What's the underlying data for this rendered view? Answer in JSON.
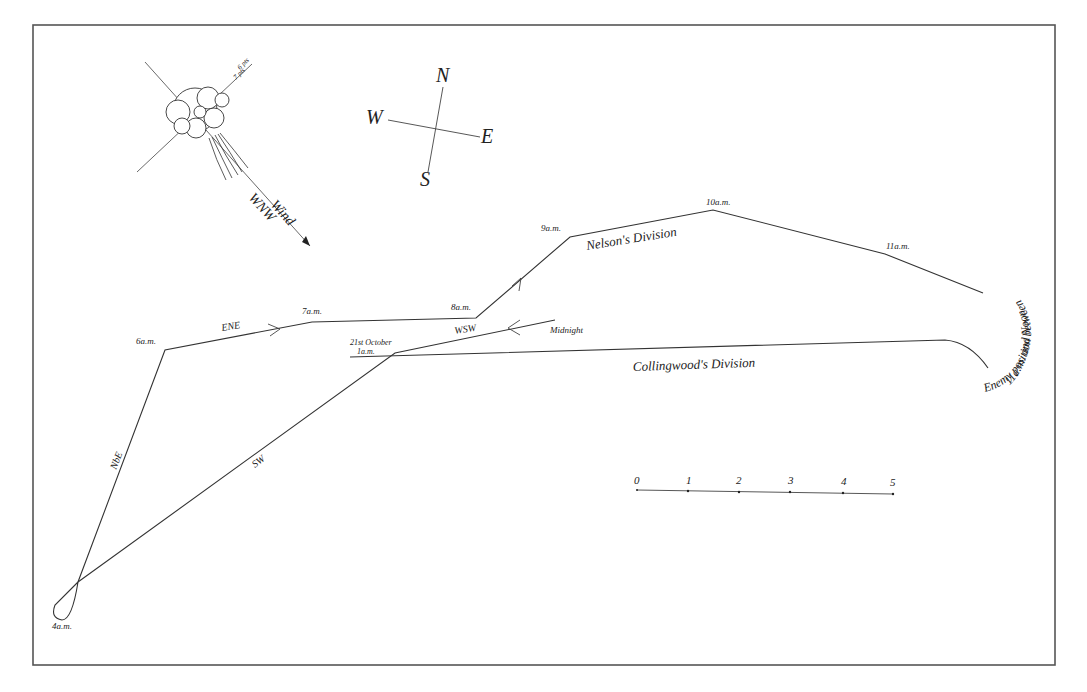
{
  "map": {
    "title": "Trafalgar approach tracks",
    "frame": {
      "x": 33,
      "y": 25,
      "width": 1022,
      "height": 640,
      "color": "#555555"
    },
    "compass": {
      "north": "N",
      "east": "E",
      "south": "S",
      "west": "W"
    },
    "wind_vane": {
      "label": "Wind",
      "direction": "WNW",
      "flag_text_1": "6 pts",
      "flag_text_2": "7 pts"
    },
    "nelson_track": {
      "name": "Nelson's Division",
      "times": [
        "4a.m.",
        "6a.m.",
        "7a.m.",
        "8a.m.",
        "9a.m.",
        "10a.m.",
        "11a.m."
      ],
      "headings": [
        "NbE",
        "ENE"
      ]
    },
    "collingwood_track": {
      "name": "Collingwood's Division",
      "start_label_line1": "21st October",
      "start_label_line2": "1a.m.",
      "midnight_label": "Midnight",
      "headings": [
        "WSW",
        "SW"
      ]
    },
    "enemy": {
      "label_line1": "Enemy position between",
      "label_line2": "11a.m. and Noon"
    },
    "scale_bar": {
      "ticks": [
        "0",
        "1",
        "2",
        "3",
        "4",
        "5"
      ]
    },
    "colors": {
      "ink": "#222222",
      "background": "#ffffff"
    }
  }
}
